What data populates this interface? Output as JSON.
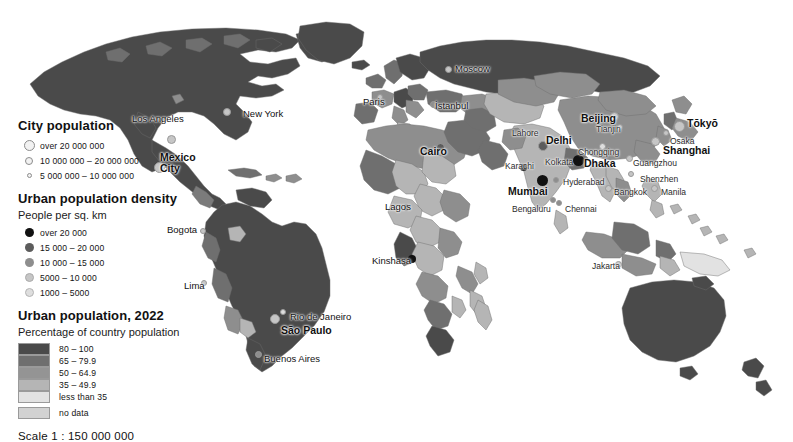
{
  "map": {
    "title": "World map of urban population 2022",
    "scale_text": "Scale 1 : 150 000 000",
    "ocean_color": "#ffffff",
    "border_color": "#6e6e6e"
  },
  "legend": {
    "city_population": {
      "title": "City population",
      "items": [
        {
          "label": "over 20 000 000",
          "size": 11
        },
        {
          "label": "10 000 000 – 20 000 000",
          "size": 8
        },
        {
          "label": "5 000 000 – 10 000 000",
          "size": 5
        }
      ]
    },
    "urban_density": {
      "title": "Urban population density",
      "subtitle": "People per sq. km",
      "items": [
        {
          "label": "over 20 000",
          "color": "#111111",
          "size": 9
        },
        {
          "label": "15 000 – 20 000",
          "color": "#5c5c5c",
          "size": 9
        },
        {
          "label": "10 000 – 15 000",
          "color": "#8e8e8e",
          "size": 9
        },
        {
          "label": "5000 – 10 000",
          "color": "#c6c6c6",
          "size": 9
        },
        {
          "label": "1000 – 5000",
          "color": "#dedede",
          "size": 9
        }
      ]
    },
    "urban_population": {
      "title": "Urban population, 2022",
      "subtitle": "Percentage of country population",
      "items": [
        {
          "label": "80 – 100",
          "color": "#4a4a4a"
        },
        {
          "label": "65 – 79.9",
          "color": "#6f6f6f"
        },
        {
          "label": "50 – 64.9",
          "color": "#949494"
        },
        {
          "label": "35 – 49.9",
          "color": "#b5b5b5"
        },
        {
          "label": "less than 35",
          "color": "#e2e2e2"
        },
        {
          "label": "no data",
          "color": "#d2d2d2"
        }
      ]
    }
  },
  "cities": [
    {
      "name": "Los Angeles",
      "x": 126,
      "y": 119,
      "cls": "mid",
      "dx": 6,
      "dy": -5,
      "dot": {
        "x": 171,
        "y": 139,
        "d": 9,
        "color": "#c6c6c6"
      }
    },
    {
      "name": "New York",
      "x": 235,
      "y": 113,
      "cls": "mid",
      "dx": 8,
      "dy": -4,
      "dot": {
        "x": 227,
        "y": 112,
        "d": 8,
        "color": "#c6c6c6"
      }
    },
    {
      "name": "Mexico\nCity",
      "x": 160,
      "y": 152,
      "cls": "big",
      "dx": 0,
      "dy": 0,
      "dot": {
        "x": 159,
        "y": 167,
        "d": 11,
        "color": "#c6c6c6"
      }
    },
    {
      "name": "Bogota",
      "x": 167,
      "y": 225,
      "cls": "mid",
      "dx": 0,
      "dy": 0,
      "dot": {
        "x": 203,
        "y": 231,
        "d": 6,
        "color": "#c6c6c6"
      }
    },
    {
      "name": "Lima",
      "x": 184,
      "y": 281,
      "cls": "mid",
      "dx": 0,
      "dy": 0,
      "dot": {
        "x": 204,
        "y": 283,
        "d": 6,
        "color": "#c6c6c6"
      }
    },
    {
      "name": "Rio de Janeiro",
      "x": 290,
      "y": 312,
      "cls": "mid",
      "dx": 0,
      "dy": 0,
      "dot": {
        "x": 283,
        "y": 312,
        "d": 6,
        "color": "#dedede"
      }
    },
    {
      "name": "São Paulo",
      "x": 281,
      "y": 325,
      "cls": "big",
      "dx": 0,
      "dy": 0,
      "dot": {
        "x": 275,
        "y": 319,
        "d": 10,
        "color": "#c6c6c6"
      }
    },
    {
      "name": "Buenos Aires",
      "x": 264,
      "y": 354,
      "cls": "mid",
      "dx": 0,
      "dy": 0,
      "dot": {
        "x": 258,
        "y": 354,
        "d": 7,
        "color": "#8e8e8e"
      }
    },
    {
      "name": "Paris",
      "x": 363,
      "y": 97,
      "cls": "mid",
      "dx": 0,
      "dy": 0,
      "dot": {
        "x": 380,
        "y": 97,
        "d": 6,
        "color": "#c6c6c6"
      }
    },
    {
      "name": "Moscow",
      "x": 455,
      "y": 64,
      "cls": "mid",
      "dx": 0,
      "dy": 0,
      "dot": {
        "x": 448,
        "y": 69,
        "d": 7,
        "color": "#c6c6c6"
      }
    },
    {
      "name": "İstanbul",
      "x": 435,
      "y": 101,
      "cls": "mid",
      "dx": 0,
      "dy": 0,
      "dot": {
        "x": 433,
        "y": 104,
        "d": 7,
        "color": "#8e8e8e"
      }
    },
    {
      "name": "Cairo",
      "x": 420,
      "y": 146,
      "cls": "big",
      "dx": 0,
      "dy": 0,
      "dot": {
        "x": 440,
        "y": 147,
        "d": 9,
        "color": "#5c5c5c"
      }
    },
    {
      "name": "Lagos",
      "x": 385,
      "y": 202,
      "cls": "mid",
      "dx": 0,
      "dy": 0,
      "dot": {
        "x": 406,
        "y": 207,
        "d": 7,
        "color": "#5c5c5c"
      }
    },
    {
      "name": "Kinshasa",
      "x": 372,
      "y": 256,
      "cls": "mid",
      "dx": 0,
      "dy": 0,
      "dot": {
        "x": 412,
        "y": 259,
        "d": 8,
        "color": "#111111"
      }
    },
    {
      "name": "Lahore",
      "x": 512,
      "y": 129,
      "cls": "small",
      "dx": 0,
      "dy": 0,
      "dot": {
        "x": 531,
        "y": 133,
        "d": 6,
        "color": "#5c5c5c"
      }
    },
    {
      "name": "Delhi",
      "x": 546,
      "y": 135,
      "cls": "big",
      "dx": 0,
      "dy": 0,
      "dot": {
        "x": 543,
        "y": 146,
        "d": 10,
        "color": "#5c5c5c"
      }
    },
    {
      "name": "Karachi",
      "x": 505,
      "y": 162,
      "cls": "small",
      "dx": 0,
      "dy": 0,
      "dot": {
        "x": 523,
        "y": 167,
        "d": 7,
        "color": "#111111"
      }
    },
    {
      "name": "Kolkata",
      "x": 545,
      "y": 158,
      "cls": "small",
      "dx": 0,
      "dy": 0,
      "dot": {
        "x": 578,
        "y": 161,
        "d": 8,
        "color": "#111111"
      }
    },
    {
      "name": "Dhaka",
      "x": 584,
      "y": 158,
      "cls": "big",
      "dx": 0,
      "dy": 0,
      "dot": {
        "x": 578,
        "y": 160,
        "d": 11,
        "color": "#111111"
      }
    },
    {
      "name": "Mumbai",
      "x": 508,
      "y": 186,
      "cls": "big",
      "dx": 0,
      "dy": 0,
      "dot": {
        "x": 542,
        "y": 180,
        "d": 11,
        "color": "#111111"
      }
    },
    {
      "name": "Hyderabad",
      "x": 563,
      "y": 178,
      "cls": "small",
      "dx": 0,
      "dy": 0,
      "dot": {
        "x": 556,
        "y": 180,
        "d": 6,
        "color": "#8e8e8e"
      }
    },
    {
      "name": "Bengaluru",
      "x": 512,
      "y": 205,
      "cls": "small",
      "dx": 0,
      "dy": 0,
      "dot": {
        "x": 553,
        "y": 200,
        "d": 6,
        "color": "#8e8e8e"
      }
    },
    {
      "name": "Chennai",
      "x": 565,
      "y": 205,
      "cls": "small",
      "dx": 0,
      "dy": 0,
      "dot": {
        "x": 559,
        "y": 203,
        "d": 6,
        "color": "#8e8e8e"
      }
    },
    {
      "name": "Beijing",
      "x": 581,
      "y": 113,
      "cls": "big",
      "dx": 0,
      "dy": 0,
      "dot": {
        "x": 614,
        "y": 116,
        "d": 9,
        "color": "#c6c6c6"
      }
    },
    {
      "name": "Tianjin",
      "x": 596,
      "y": 125,
      "cls": "small",
      "dx": 0,
      "dy": 0,
      "dot": {
        "x": 620,
        "y": 127,
        "d": 6,
        "color": "#c6c6c6"
      }
    },
    {
      "name": "Chongqing",
      "x": 578,
      "y": 148,
      "cls": "small",
      "dx": 0,
      "dy": 0,
      "dot": {
        "x": 602,
        "y": 146,
        "d": 7,
        "color": "#dedede"
      }
    },
    {
      "name": "Shanghai",
      "x": 663,
      "y": 145,
      "cls": "big",
      "dx": 0,
      "dy": 0,
      "dot": {
        "x": 655,
        "y": 141,
        "d": 9,
        "color": "#c6c6c6"
      }
    },
    {
      "name": "Guangzhou",
      "x": 633,
      "y": 159,
      "cls": "small",
      "dx": 0,
      "dy": 0,
      "dot": {
        "x": 629,
        "y": 158,
        "d": 7,
        "color": "#c6c6c6"
      }
    },
    {
      "name": "Shenzhen",
      "x": 640,
      "y": 175,
      "cls": "small",
      "dx": 0,
      "dy": 0,
      "dot": {
        "x": 631,
        "y": 174,
        "d": 6,
        "color": "#c6c6c6"
      }
    },
    {
      "name": "Tōkyō",
      "x": 687,
      "y": 118,
      "cls": "big",
      "dx": 0,
      "dy": 0,
      "dot": {
        "x": 679,
        "y": 126,
        "d": 11,
        "color": "#c6c6c6"
      }
    },
    {
      "name": "Osaka",
      "x": 670,
      "y": 137,
      "cls": "small",
      "dx": 0,
      "dy": 0,
      "dot": {
        "x": 666,
        "y": 133,
        "d": 6,
        "color": "#c6c6c6"
      }
    },
    {
      "name": "Bangkok",
      "x": 614,
      "y": 188,
      "cls": "small",
      "dx": 0,
      "dy": 0,
      "dot": {
        "x": 608,
        "y": 188,
        "d": 7,
        "color": "#c6c6c6"
      }
    },
    {
      "name": "Manila",
      "x": 661,
      "y": 188,
      "cls": "small",
      "dx": 0,
      "dy": 0,
      "dot": {
        "x": 654,
        "y": 188,
        "d": 7,
        "color": "#c6c6c6"
      }
    },
    {
      "name": "Jakarta",
      "x": 592,
      "y": 262,
      "cls": "small",
      "dx": 0,
      "dy": 0,
      "dot": {
        "x": 618,
        "y": 264,
        "d": 7,
        "color": "#c6c6c6"
      }
    }
  ]
}
